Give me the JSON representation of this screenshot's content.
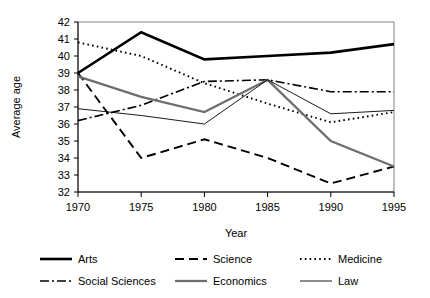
{
  "chart_data": {
    "type": "line",
    "title": "",
    "xlabel": "Year",
    "ylabel": "Average age",
    "categories": [
      1970,
      1975,
      1980,
      1985,
      1990,
      1995
    ],
    "x_tick_labels": [
      "1970",
      "1975",
      "1980",
      "1985",
      "1990",
      "1995"
    ],
    "y_tick_labels": [
      "32",
      "33",
      "34",
      "35",
      "36",
      "37",
      "38",
      "39",
      "40",
      "41",
      "42"
    ],
    "xlim": [
      1970,
      1995
    ],
    "ylim": [
      32,
      42
    ],
    "grid": false,
    "legend_position": "bottom",
    "series": [
      {
        "name": "Arts",
        "style": "thick-solid",
        "color": "#000000",
        "values": [
          39.0,
          41.4,
          39.8,
          40.0,
          40.2,
          40.7
        ]
      },
      {
        "name": "Science",
        "style": "dashed",
        "color": "#000000",
        "values": [
          39.0,
          34.0,
          35.1,
          34.0,
          32.5,
          33.5
        ]
      },
      {
        "name": "Medicine",
        "style": "dotted",
        "color": "#000000",
        "values": [
          40.8,
          40.0,
          38.4,
          37.2,
          36.1,
          36.7
        ]
      },
      {
        "name": "Social Sciences",
        "style": "dash-dot",
        "color": "#000000",
        "values": [
          36.2,
          37.1,
          38.5,
          38.6,
          37.9,
          37.9
        ]
      },
      {
        "name": "Economics",
        "style": "medium-solid-gray",
        "color": "#6e6e6e",
        "values": [
          38.8,
          37.6,
          36.7,
          38.6,
          35.0,
          33.5
        ]
      },
      {
        "name": "Law",
        "style": "thin-solid",
        "color": "#000000",
        "values": [
          36.9,
          36.5,
          36.0,
          38.6,
          36.6,
          36.8
        ]
      }
    ]
  },
  "axis": {
    "x_title": "Year",
    "y_title": "Average age"
  },
  "legend": {
    "entries": [
      {
        "label": "Arts"
      },
      {
        "label": "Science"
      },
      {
        "label": "Medicine"
      },
      {
        "label": "Social Sciences"
      },
      {
        "label": "Economics"
      },
      {
        "label": "Law"
      }
    ]
  }
}
